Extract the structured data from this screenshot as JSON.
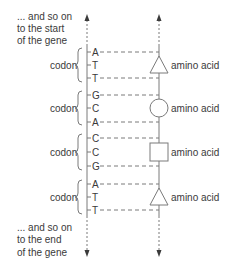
{
  "top_note": [
    "... and  so on",
    "to the start",
    "of the gene"
  ],
  "bottom_note": [
    "... and  so on",
    "to the end",
    "of the gene"
  ],
  "colors": {
    "line": "#7a7a7a",
    "text": "#3a3a3a"
  },
  "codons": [
    {
      "label": "codon",
      "bases": [
        "A",
        "T",
        "T"
      ],
      "amino_acid": "amino acid",
      "shape": "triangle"
    },
    {
      "label": "codon",
      "bases": [
        "G",
        "C",
        "A"
      ],
      "amino_acid": "amino acid",
      "shape": "circle"
    },
    {
      "label": "codon",
      "bases": [
        "C",
        "C",
        "G"
      ],
      "amino_acid": "amino acid",
      "shape": "square"
    },
    {
      "label": "codon",
      "bases": [
        "A",
        "T",
        "T"
      ],
      "amino_acid": "amino acid",
      "shape": "triangle"
    }
  ]
}
